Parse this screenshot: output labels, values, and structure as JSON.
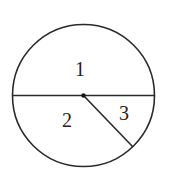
{
  "diagram": {
    "type": "circle-divided-regions",
    "stroke_color": "#2a2a2a",
    "circle": {
      "cx": 83.5,
      "cy": 95.5,
      "r": 71
    },
    "diameter": {
      "x1": 12.5,
      "y1": 95.5,
      "x2": 154.5,
      "y2": 95.5
    },
    "radius_segment": {
      "x1": 83.5,
      "y1": 95.5,
      "x2": 133,
      "y2": 147
    },
    "center_point": {
      "cx": 83.5,
      "cy": 95.5,
      "r": 2.2
    },
    "regions": [
      {
        "label": "1",
        "x": 80,
        "y": 76
      },
      {
        "label": "2",
        "x": 67,
        "y": 126.5
      },
      {
        "label": "3",
        "x": 124,
        "y": 120
      }
    ]
  }
}
